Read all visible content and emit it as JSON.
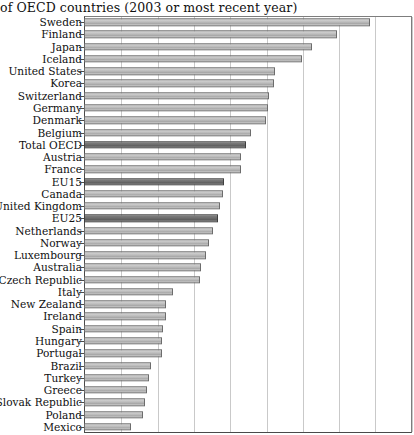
{
  "chart_title": "of OECD countries (2003 or most recent year)",
  "axis": {
    "plot_left_px": 84,
    "plot_right_px": 412,
    "grid_spacing_px": 36.3,
    "gridline_count": 9
  },
  "colors": {
    "bar_fill": "#bcbcbc",
    "bar_highlight_fill": "#6e6e6e",
    "bar_border": "#6c6c6c",
    "gridline": "#c9c9c9",
    "axis": "#4a4a4a",
    "text": "#101010",
    "background": "#ffffff"
  },
  "chart_data": {
    "type": "bar",
    "orientation": "horizontal",
    "title": "of OECD countries (2003 or most recent year)",
    "xlabel": "",
    "ylabel": "",
    "xlim": [
      0,
      9
    ],
    "grid": true,
    "legend": "none",
    "highlighted_categories": [
      "Total OECD",
      "EU15",
      "EU25"
    ],
    "categories": [
      "Sweden",
      "Finland",
      "Japan",
      "Iceland",
      "United States",
      "Korea",
      "Switzerland",
      "Germany",
      "Denmark",
      "Belgium",
      "Total OECD",
      "Austria",
      "France",
      "EU15",
      "Canada",
      "United Kingdom",
      "EU25",
      "Netherlands",
      "Norway",
      "Luxembourg",
      "Australia",
      "Czech Republic",
      "Italy",
      "New Zealand",
      "Ireland",
      "Spain",
      "Hungary",
      "Portugal",
      "Brazil",
      "Turkey",
      "Greece",
      "Slovak Republic",
      "Poland",
      "Mexico"
    ],
    "values": [
      7.88,
      6.97,
      6.28,
      6.0,
      5.26,
      5.23,
      5.1,
      5.07,
      5.01,
      4.6,
      4.46,
      4.33,
      4.33,
      3.86,
      3.83,
      3.75,
      3.69,
      3.55,
      3.44,
      3.36,
      3.22,
      3.19,
      2.45,
      2.26,
      2.26,
      2.18,
      2.15,
      2.15,
      1.85,
      1.79,
      1.74,
      1.68,
      1.63,
      1.29
    ]
  },
  "rows": [
    {
      "label": "Sweden",
      "value": 7.88,
      "highlight": false
    },
    {
      "label": "Finland",
      "value": 6.97,
      "highlight": false
    },
    {
      "label": "Japan",
      "value": 6.28,
      "highlight": false
    },
    {
      "label": "Iceland",
      "value": 6.0,
      "highlight": false
    },
    {
      "label": "United States",
      "value": 5.26,
      "highlight": false
    },
    {
      "label": "Korea",
      "value": 5.23,
      "highlight": false
    },
    {
      "label": "Switzerland",
      "value": 5.1,
      "highlight": false
    },
    {
      "label": "Germany",
      "value": 5.07,
      "highlight": false
    },
    {
      "label": "Denmark",
      "value": 5.01,
      "highlight": false
    },
    {
      "label": "Belgium",
      "value": 4.6,
      "highlight": false
    },
    {
      "label": "Total OECD",
      "value": 4.46,
      "highlight": true
    },
    {
      "label": "Austria",
      "value": 4.33,
      "highlight": false
    },
    {
      "label": "France",
      "value": 4.33,
      "highlight": false
    },
    {
      "label": "EU15",
      "value": 3.86,
      "highlight": true
    },
    {
      "label": "Canada",
      "value": 3.83,
      "highlight": false
    },
    {
      "label": "United Kingdom",
      "value": 3.75,
      "highlight": false
    },
    {
      "label": "EU25",
      "value": 3.69,
      "highlight": true
    },
    {
      "label": "Netherlands",
      "value": 3.55,
      "highlight": false
    },
    {
      "label": "Norway",
      "value": 3.44,
      "highlight": false
    },
    {
      "label": "Luxembourg",
      "value": 3.36,
      "highlight": false
    },
    {
      "label": "Australia",
      "value": 3.22,
      "highlight": false
    },
    {
      "label": "Czech Republic",
      "value": 3.19,
      "highlight": false
    },
    {
      "label": "Italy",
      "value": 2.45,
      "highlight": false
    },
    {
      "label": "New Zealand",
      "value": 2.26,
      "highlight": false
    },
    {
      "label": "Ireland",
      "value": 2.26,
      "highlight": false
    },
    {
      "label": "Spain",
      "value": 2.18,
      "highlight": false
    },
    {
      "label": "Hungary",
      "value": 2.15,
      "highlight": false
    },
    {
      "label": "Portugal",
      "value": 2.15,
      "highlight": false
    },
    {
      "label": "Brazil",
      "value": 1.85,
      "highlight": false
    },
    {
      "label": "Turkey",
      "value": 1.79,
      "highlight": false
    },
    {
      "label": "Greece",
      "value": 1.74,
      "highlight": false
    },
    {
      "label": "Slovak Republic",
      "value": 1.68,
      "highlight": false
    },
    {
      "label": "Poland",
      "value": 1.63,
      "highlight": false
    },
    {
      "label": "Mexico",
      "value": 1.29,
      "highlight": false
    }
  ]
}
